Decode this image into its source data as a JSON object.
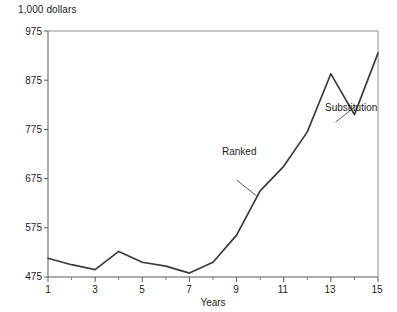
{
  "chart_data": {
    "type": "line",
    "title": "",
    "subtitle": "",
    "unit_label": "1,000 dollars",
    "xlabel": "Years",
    "ylabel": "",
    "xlim": [
      1,
      15
    ],
    "ylim": [
      475,
      975
    ],
    "grid": false,
    "legend": "none",
    "y_ticks": [
      475,
      575,
      675,
      775,
      875,
      975
    ],
    "x_ticks": [
      1,
      3,
      5,
      7,
      9,
      11,
      13,
      15
    ],
    "x_minor_ticks": [
      2,
      4,
      6,
      8,
      10,
      12,
      14
    ],
    "series": [
      {
        "name": "Ranked",
        "x": [
          1,
          2,
          3,
          4,
          5,
          6,
          7,
          8,
          9,
          10,
          11,
          12,
          13,
          14,
          15
        ],
        "values": [
          513,
          500,
          490,
          527,
          505,
          497,
          483,
          505,
          560,
          650,
          700,
          770,
          888,
          805,
          930
        ]
      }
    ],
    "annotations": [
      {
        "text": "Ranked",
        "x": 9.0,
        "y": 672,
        "points_to_x": 9.9,
        "points_to_y": 638
      },
      {
        "text": "Substitution",
        "x": 13.2,
        "y": 790,
        "points_to_x": 14.05,
        "points_to_y": 822
      }
    ]
  },
  "axis": {
    "unit_label": "1,000 dollars",
    "x_title": "Years",
    "y_tick_labels": [
      "975",
      "875",
      "775",
      "675",
      "575",
      "475"
    ],
    "x_tick_labels": [
      "1",
      "3",
      "5",
      "7",
      "9",
      "11",
      "13",
      "15"
    ]
  },
  "annotations": {
    "ranked": "Ranked",
    "substitution": "Substitution"
  },
  "colors": {
    "line": "#3b3b3b",
    "axis": "#5a5a5a",
    "text": "#1c1c1c",
    "background": "#ffffff"
  }
}
